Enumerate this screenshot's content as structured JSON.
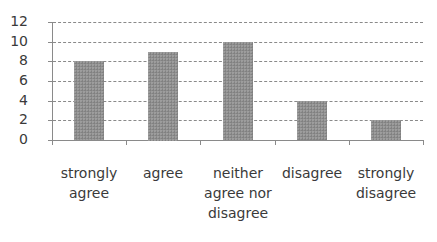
{
  "chart_data": {
    "type": "bar",
    "title": "",
    "xlabel": "",
    "ylabel": "",
    "categories": [
      "strongly agree",
      "agree",
      "neither agree nor disagree",
      "disagree",
      "strongly disagree"
    ],
    "category_labels_display": [
      "strongly\nagree",
      "agree",
      "neither\nagree nor\ndisagree",
      "disagree",
      "strongly\ndisagree"
    ],
    "values": [
      8,
      9,
      10,
      4,
      2
    ],
    "ylim": [
      0,
      12
    ],
    "yticks": [
      0,
      2,
      4,
      6,
      8,
      10,
      12
    ],
    "ytick_labels": [
      "0",
      "2",
      "4",
      "6",
      "8",
      "10",
      "12"
    ],
    "grid": true,
    "grid_style": "dashed",
    "legend": null,
    "bar_color": "#8e8e8e"
  }
}
